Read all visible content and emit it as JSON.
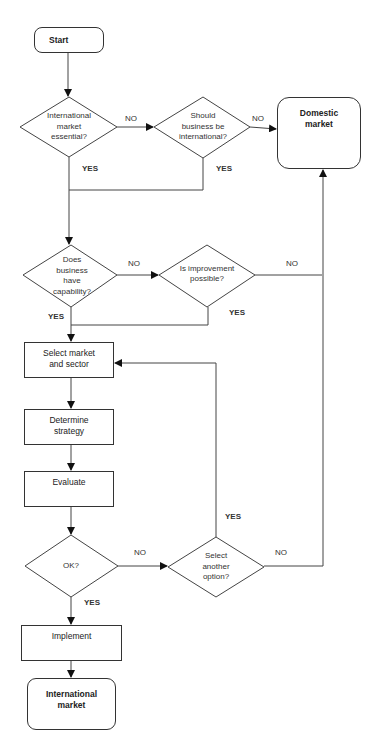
{
  "nodes": {
    "start": "Start",
    "q_essential": "International market essential?",
    "q_should": "Should business be international?",
    "domestic": "Domestic market",
    "q_capability": "Does business have capability?",
    "q_improve": "Is improvement possible?",
    "select_market": "Select market and sector",
    "determine_strategy": "Determine strategy",
    "evaluate": "Evaluate",
    "q_ok": "OK?",
    "q_another": "Select another option?",
    "implement": "Implement",
    "international": "International market"
  },
  "labels": {
    "essential_no": "NO",
    "essential_yes": "YES",
    "should_no": "NO",
    "should_yes": "YES",
    "capability_no": "NO",
    "capability_yes": "YES",
    "improve_no": "NO",
    "improve_yes": "YES",
    "ok_no": "NO",
    "ok_yes": "YES",
    "another_no": "NO",
    "another_yes": "YES"
  },
  "colors": {
    "line": "#333333",
    "background": "#ffffff"
  }
}
